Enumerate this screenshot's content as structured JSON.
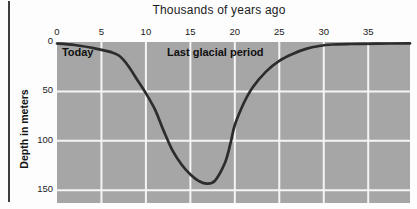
{
  "chart_data": {
    "type": "line",
    "title": "Thousands of years ago",
    "xlabel": "Thousands of years ago",
    "ylabel": "Depth in meters",
    "x_axis_position": "top",
    "y_axis_direction": "depth-downward",
    "xlim": [
      0,
      39.7
    ],
    "depth_max": 163,
    "x_ticks": [
      0,
      5,
      10,
      15,
      20,
      25,
      30,
      35
    ],
    "y_ticks": [
      0,
      50,
      100,
      150
    ],
    "grid": true,
    "legend": "none",
    "annotations": [
      {
        "text": "Today",
        "t": 0.55,
        "depth": 4.2,
        "align": "left"
      },
      {
        "text": "Last glacial period",
        "t": 17.8,
        "depth": 4.2,
        "align": "center"
      }
    ],
    "series": [
      {
        "name": "Sea level depth below present",
        "points": [
          [
            0,
            1.5
          ],
          [
            2,
            3
          ],
          [
            4,
            6
          ],
          [
            5,
            8
          ],
          [
            6,
            10
          ],
          [
            7,
            14
          ],
          [
            8,
            24
          ],
          [
            9,
            38
          ],
          [
            10,
            52
          ],
          [
            11,
            68
          ],
          [
            12,
            90
          ],
          [
            13,
            110
          ],
          [
            14,
            124
          ],
          [
            15,
            134
          ],
          [
            16,
            141
          ],
          [
            16.9,
            143.5
          ],
          [
            17.8,
            140
          ],
          [
            18.9,
            122
          ],
          [
            19.5,
            103
          ],
          [
            20,
            84
          ],
          [
            21,
            62
          ],
          [
            22,
            46
          ],
          [
            23.5,
            30
          ],
          [
            25,
            19
          ],
          [
            26.5,
            12
          ],
          [
            28,
            7
          ],
          [
            29.5,
            4
          ],
          [
            31,
            2.5
          ],
          [
            33,
            2
          ],
          [
            36,
            1.6
          ],
          [
            39.7,
            1.4
          ]
        ]
      }
    ],
    "colors": {
      "plot_bg": "#a6a6a6",
      "grid": "#f5f5f5",
      "curve": "#2c2c2c",
      "text": "#1b1b1b",
      "figure_bg": "#fdfdfd",
      "border_rule": "#3d3d3d"
    }
  }
}
